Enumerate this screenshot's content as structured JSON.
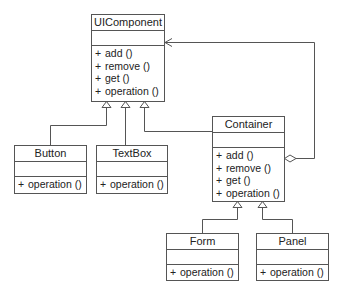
{
  "diagram": {
    "type": "UML class diagram (Composite pattern)",
    "classes": [
      {
        "id": "uicomponent",
        "name": "UIComponent",
        "operations": [
          {
            "visibility": "+",
            "label": "add ()"
          },
          {
            "visibility": "+",
            "label": "remove ()"
          },
          {
            "visibility": "+",
            "label": "get ()"
          },
          {
            "visibility": "+",
            "label": "operation ()"
          }
        ]
      },
      {
        "id": "button",
        "name": "Button",
        "operations": [
          {
            "visibility": "+",
            "label": "operation ()"
          }
        ]
      },
      {
        "id": "textbox",
        "name": "TextBox",
        "operations": [
          {
            "visibility": "+",
            "label": "operation ()"
          }
        ]
      },
      {
        "id": "container",
        "name": "Container",
        "operations": [
          {
            "visibility": "+",
            "label": "add ()"
          },
          {
            "visibility": "+",
            "label": "remove ()"
          },
          {
            "visibility": "+",
            "label": "get ()"
          },
          {
            "visibility": "+",
            "label": "operation ()"
          }
        ]
      },
      {
        "id": "form",
        "name": "Form",
        "operations": [
          {
            "visibility": "+",
            "label": "operation ()"
          }
        ]
      },
      {
        "id": "panel",
        "name": "Panel",
        "operations": [
          {
            "visibility": "+",
            "label": "operation ()"
          }
        ]
      }
    ],
    "relationships": [
      {
        "type": "generalization",
        "from": "Button",
        "to": "UIComponent"
      },
      {
        "type": "generalization",
        "from": "TextBox",
        "to": "UIComponent"
      },
      {
        "type": "generalization",
        "from": "Container",
        "to": "UIComponent"
      },
      {
        "type": "generalization",
        "from": "Form",
        "to": "Container"
      },
      {
        "type": "generalization",
        "from": "Panel",
        "to": "Container"
      },
      {
        "type": "aggregation",
        "from": "Container",
        "to": "UIComponent"
      }
    ],
    "colors": {
      "line": "#555555",
      "background": "#ffffff",
      "text": "#222222"
    }
  }
}
